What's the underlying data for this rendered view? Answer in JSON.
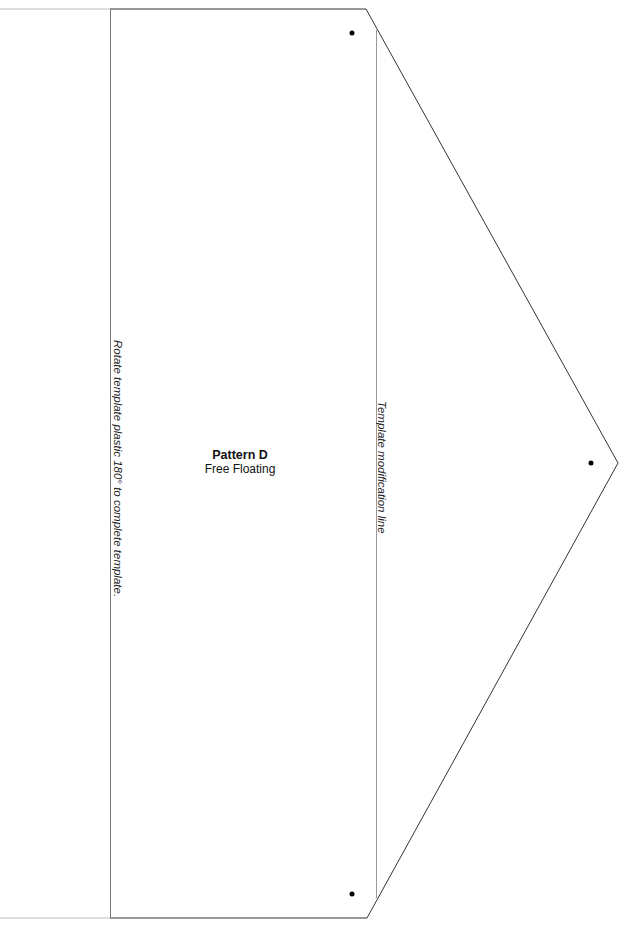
{
  "pattern": {
    "title": "Pattern D",
    "subtitle": "Free Floating"
  },
  "annotations": {
    "rotate_note": "Rotate template plastic 180° to complete template.",
    "modification_line_label": "Template modification line"
  },
  "colors": {
    "outline": "#333333",
    "guide_line": "#999999",
    "faint_edge": "#bbbbbb",
    "dot": "#000000"
  }
}
